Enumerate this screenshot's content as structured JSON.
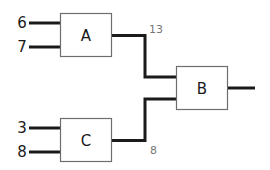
{
  "diagram": {
    "type": "logic-block-diagram",
    "blocks": [
      {
        "id": "A",
        "label": "A"
      },
      {
        "id": "B",
        "label": "B"
      },
      {
        "id": "C",
        "label": "C"
      }
    ],
    "inputs": {
      "A": [
        "6",
        "7"
      ],
      "C": [
        "3",
        "8"
      ]
    },
    "connections": [
      {
        "from": "A",
        "to": "B",
        "value": "13"
      },
      {
        "from": "C",
        "to": "B",
        "value": "8"
      }
    ],
    "colors": {
      "wire": "#1a1a1a",
      "box_border": "#6e6e6e",
      "value_label": "#777777",
      "background": "#ffffff"
    }
  }
}
